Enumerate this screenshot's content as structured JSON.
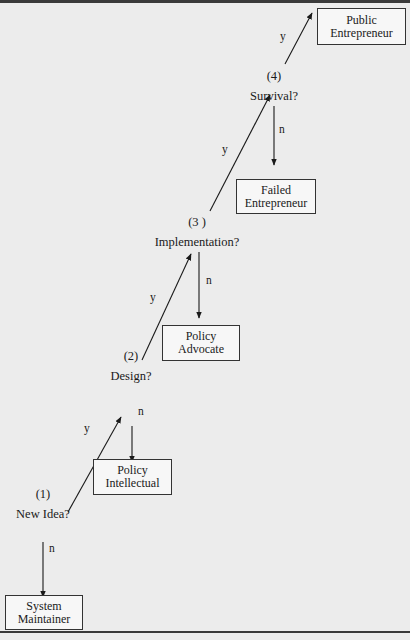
{
  "diagram": {
    "decisions": [
      {
        "number": "(1)",
        "question": "New Idea?"
      },
      {
        "number": "(2)",
        "question": "Design?"
      },
      {
        "number": "(3 )",
        "question": "Implementation?"
      },
      {
        "number": "(4)",
        "question": "Survival?"
      }
    ],
    "outcomes": {
      "public_entrepreneur": {
        "line1": "Public",
        "line2": "Entrepreneur"
      },
      "failed_entrepreneur": {
        "line1": "Failed",
        "line2": "Entrepreneur"
      },
      "policy_advocate": {
        "line1": "Policy",
        "line2": "Advocate"
      },
      "policy_intellectual": {
        "line1": "Policy",
        "line2": "Intellectual"
      },
      "system_maintainer": {
        "line1": "System",
        "line2": "Maintainer"
      }
    },
    "edge_labels": {
      "yes": "y",
      "no": "n"
    },
    "edges": [
      {
        "from": "New Idea?",
        "to": "Design?",
        "label": "y"
      },
      {
        "from": "New Idea?",
        "to": "System Maintainer",
        "label": "n"
      },
      {
        "from": "Design?",
        "to": "Implementation?",
        "label": "y"
      },
      {
        "from": "Design?",
        "to": "Policy Intellectual",
        "label": "n"
      },
      {
        "from": "Implementation?",
        "to": "Survival?",
        "label": "y"
      },
      {
        "from": "Implementation?",
        "to": "Policy Advocate",
        "label": "n"
      },
      {
        "from": "Survival?",
        "to": "Public Entrepreneur",
        "label": "y"
      },
      {
        "from": "Survival?",
        "to": "Failed Entrepreneur",
        "label": "n"
      }
    ]
  }
}
